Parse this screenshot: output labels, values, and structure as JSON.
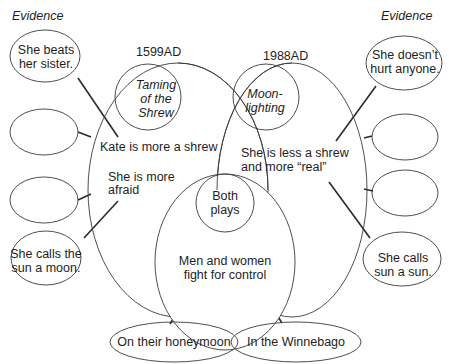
{
  "diagram": {
    "type": "compare-contrast venn with evidence bubbles",
    "left_header": "Evidence",
    "right_header": "Evidence",
    "left_work": {
      "year": "1599AD",
      "title_lines": [
        "Taming",
        "of the",
        "Shrew"
      ],
      "points": [
        {
          "lines": [
            "Kate is more a shrew"
          ]
        },
        {
          "lines": [
            "She is more",
            "afraid"
          ]
        }
      ]
    },
    "right_work": {
      "year": "1988AD",
      "title_lines": [
        "Moon-",
        "lighting"
      ],
      "points": [
        {
          "lines": [
            "She is less a shrew",
            "and more “real”"
          ]
        }
      ]
    },
    "shared": {
      "label_lines": [
        "Both",
        "plays"
      ],
      "points": [
        {
          "lines": [
            "Men and women",
            "fight for control"
          ]
        }
      ]
    },
    "left_evidence": [
      {
        "lines": [
          "She beats",
          "her sister."
        ]
      },
      {
        "lines": []
      },
      {
        "lines": []
      },
      {
        "lines": [
          "She calls the",
          "sun a moon."
        ]
      }
    ],
    "right_evidence": [
      {
        "lines": [
          "She doesn’t",
          "hurt anyone."
        ]
      },
      {
        "lines": []
      },
      {
        "lines": []
      },
      {
        "lines": [
          "She calls",
          "sun a sun."
        ]
      }
    ],
    "shared_evidence": [
      {
        "lines": [
          "On their honeymoon"
        ]
      },
      {
        "lines": [
          "In the Winnebago"
        ]
      }
    ]
  }
}
